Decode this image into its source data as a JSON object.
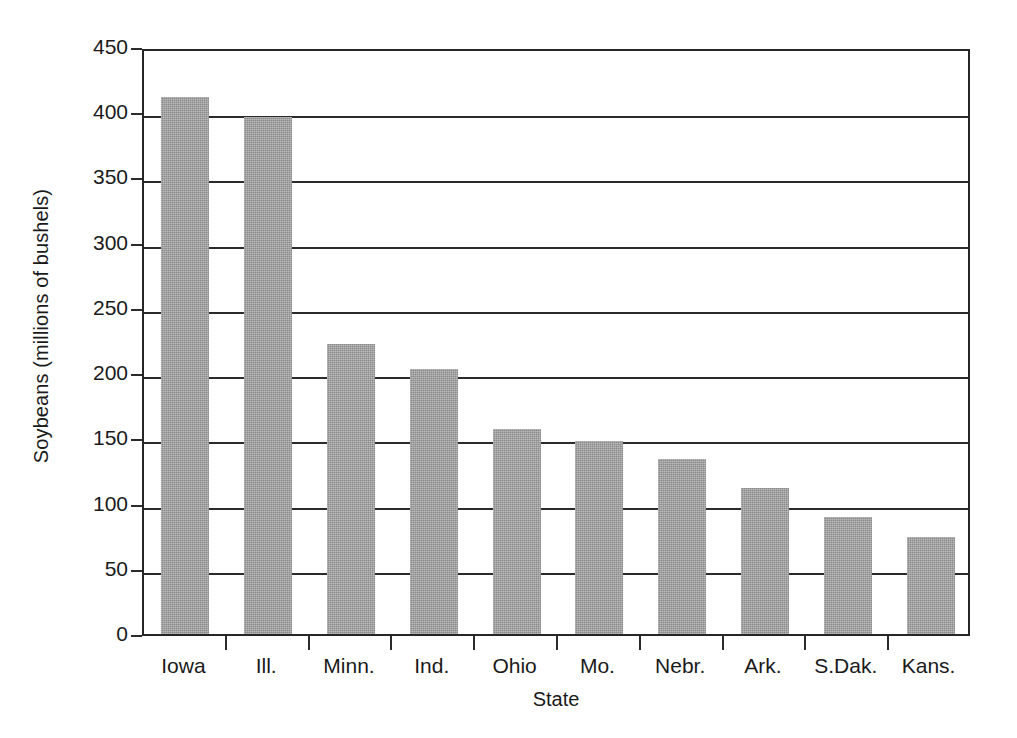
{
  "chart_data": {
    "type": "bar",
    "title": "",
    "xlabel": "State",
    "ylabel": "Soybeans (millions of bushels)",
    "categories": [
      "Iowa",
      "Ill.",
      "Minn.",
      "Ind.",
      "Ohio",
      "Mo.",
      "Nebr.",
      "Ark.",
      "S.Dak.",
      "Kans."
    ],
    "values": [
      412,
      396,
      222,
      203,
      157,
      148,
      134,
      112,
      90,
      74
    ],
    "ylim": [
      0,
      450
    ],
    "yticks": [
      0,
      50,
      100,
      150,
      200,
      250,
      300,
      350,
      400,
      450
    ],
    "ytick_labels": [
      "0",
      "50",
      "100",
      "150",
      "200",
      "250",
      "300",
      "350",
      "400",
      "450"
    ],
    "grid": true,
    "legend": null,
    "bar_color": "#9a9a9a",
    "axis_color": "#2b2b2b",
    "background_color": "#ffffff"
  }
}
